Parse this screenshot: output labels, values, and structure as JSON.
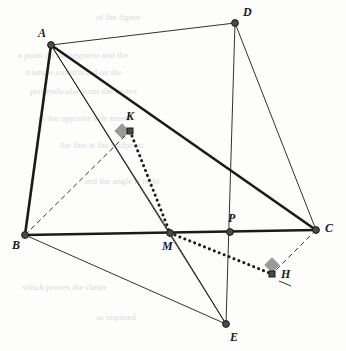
{
  "figure": {
    "canvas": {
      "width": 346,
      "height": 351
    },
    "background_color": "#fdfdfc",
    "stroke_color": "#1a1a1a",
    "vertex_fill": "#4a4a4a",
    "right_angle_marker_color": "#9a9a9a",
    "points": [
      {
        "id": "A",
        "label": "A",
        "x": 51,
        "y": 45,
        "label_x": 38,
        "label_y": 27
      },
      {
        "id": "B",
        "label": "B",
        "x": 25,
        "y": 235,
        "label_x": 12,
        "label_y": 239
      },
      {
        "id": "C",
        "label": "C",
        "x": 316,
        "y": 230,
        "label_x": 325,
        "label_y": 222
      },
      {
        "id": "D",
        "label": "D",
        "x": 235,
        "y": 23,
        "label_x": 243,
        "label_y": 6
      },
      {
        "id": "E",
        "label": "E",
        "x": 226,
        "y": 324,
        "label_x": 230,
        "label_y": 331
      },
      {
        "id": "H",
        "label": "H",
        "x": 272,
        "y": 274,
        "label_x": 281,
        "label_y": 268
      },
      {
        "id": "K",
        "label": "K",
        "x": 130,
        "y": 131,
        "label_x": 126,
        "label_y": 110
      },
      {
        "id": "M",
        "label": "M",
        "x": 170,
        "y": 233,
        "label_x": 162,
        "label_y": 240
      },
      {
        "id": "P",
        "label": "P",
        "x": 230,
        "y": 232,
        "label_x": 228,
        "label_y": 212
      }
    ],
    "segments": [
      {
        "id": "A-B",
        "from": "A",
        "to": "B",
        "style": "thick",
        "name": "segment-ab"
      },
      {
        "id": "A-C",
        "from": "A",
        "to": "C",
        "style": "thick",
        "name": "segment-ac"
      },
      {
        "id": "B-C",
        "from": "B",
        "to": "C",
        "style": "thick",
        "name": "segment-bc"
      },
      {
        "id": "A-D",
        "from": "A",
        "to": "D",
        "style": "thin",
        "name": "segment-ad"
      },
      {
        "id": "D-C",
        "from": "D",
        "to": "C",
        "style": "thin",
        "name": "segment-dc"
      },
      {
        "id": "A-E",
        "from": "A",
        "to": "E",
        "style": "thin",
        "name": "segment-ae"
      },
      {
        "id": "A-M",
        "from": "A",
        "to": "M",
        "style": "thin",
        "name": "segment-am"
      },
      {
        "id": "B-E",
        "from": "B",
        "to": "E",
        "style": "thin",
        "name": "segment-be"
      },
      {
        "id": "D-E",
        "from": "D",
        "to": "E",
        "style": "thin",
        "name": "segment-de"
      },
      {
        "id": "M-E",
        "from": "M",
        "to": "E",
        "style": "thin",
        "name": "segment-me"
      },
      {
        "id": "B-K",
        "from": "B",
        "to": "K",
        "style": "dashed",
        "name": "segment-bk"
      },
      {
        "id": "C-H",
        "from": "C",
        "to": "H",
        "style": "dashed",
        "name": "segment-ch"
      },
      {
        "id": "K-M",
        "from": "K",
        "to": "M",
        "style": "dotted",
        "name": "segment-km"
      },
      {
        "id": "M-H",
        "from": "M",
        "to": "H",
        "style": "dotted",
        "name": "segment-mh"
      }
    ],
    "right_angle_markers": [
      {
        "id": "K-right-angle",
        "at": "K",
        "x": 122,
        "y": 131,
        "rotation": 45,
        "size": 11,
        "name": "right-angle-marker-k"
      },
      {
        "id": "H-right-angle",
        "at": "H",
        "x": 272,
        "y": 265,
        "rotation": 45,
        "size": 11,
        "name": "right-angle-marker-h"
      }
    ],
    "tick_marks": [
      {
        "id": "H-tick",
        "x1": 279,
        "y1": 281,
        "x2": 291,
        "y2": 286,
        "name": "tick-mark-h"
      }
    ],
    "background_text": [
      {
        "text": "of the figure",
        "x": 96,
        "y": 12
      },
      {
        "text": "a point on the segment and the",
        "x": 18,
        "y": 50
      },
      {
        "text": "triangle constructed on the",
        "x": 26,
        "y": 67
      },
      {
        "text": "perpendicular from the vertex",
        "x": 30,
        "y": 86
      },
      {
        "text": "to the opposite side meets",
        "x": 38,
        "y": 113
      },
      {
        "text": "the line at the midpoint",
        "x": 60,
        "y": 140
      },
      {
        "text": "and the angle is right",
        "x": 84,
        "y": 176
      },
      {
        "text": "which proves the claim",
        "x": 22,
        "y": 282
      },
      {
        "text": "as required",
        "x": 96,
        "y": 312
      }
    ]
  }
}
